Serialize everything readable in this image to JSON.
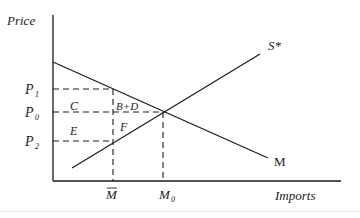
{
  "diagram": {
    "y_axis_label": "Price",
    "x_axis_label": "Imports",
    "supply_label": "S*",
    "demand_label": "M",
    "price_labels": {
      "p1": {
        "main": "P",
        "sub": "1"
      },
      "p0": {
        "main": "P",
        "sub": "0"
      },
      "p2": {
        "main": "P",
        "sub": "2"
      }
    },
    "quantity_labels": {
      "m_bar": "M",
      "m0": {
        "main": "M",
        "sub": "0"
      }
    },
    "area_labels": {
      "c": "C",
      "bd": "B+D",
      "e": "E",
      "f": "F"
    },
    "colors": {
      "line": "#1a1a1a",
      "text": "#222222"
    }
  }
}
